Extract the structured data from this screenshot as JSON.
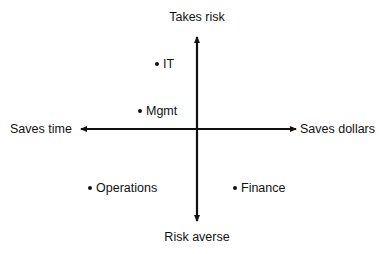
{
  "diagram": {
    "type": "quadrant",
    "axes": {
      "top": "Takes risk",
      "bottom": "Risk averse",
      "left": "Saves time",
      "right": "Saves dollars"
    },
    "points": [
      {
        "label": "IT",
        "x": 157,
        "y": 64
      },
      {
        "label": "Mgmt",
        "x": 140,
        "y": 111
      },
      {
        "label": "Operations",
        "x": 90,
        "y": 188
      },
      {
        "label": "Finance",
        "x": 235,
        "y": 188
      }
    ],
    "colors": {
      "ink": "#111111",
      "background": "#ffffff"
    }
  }
}
